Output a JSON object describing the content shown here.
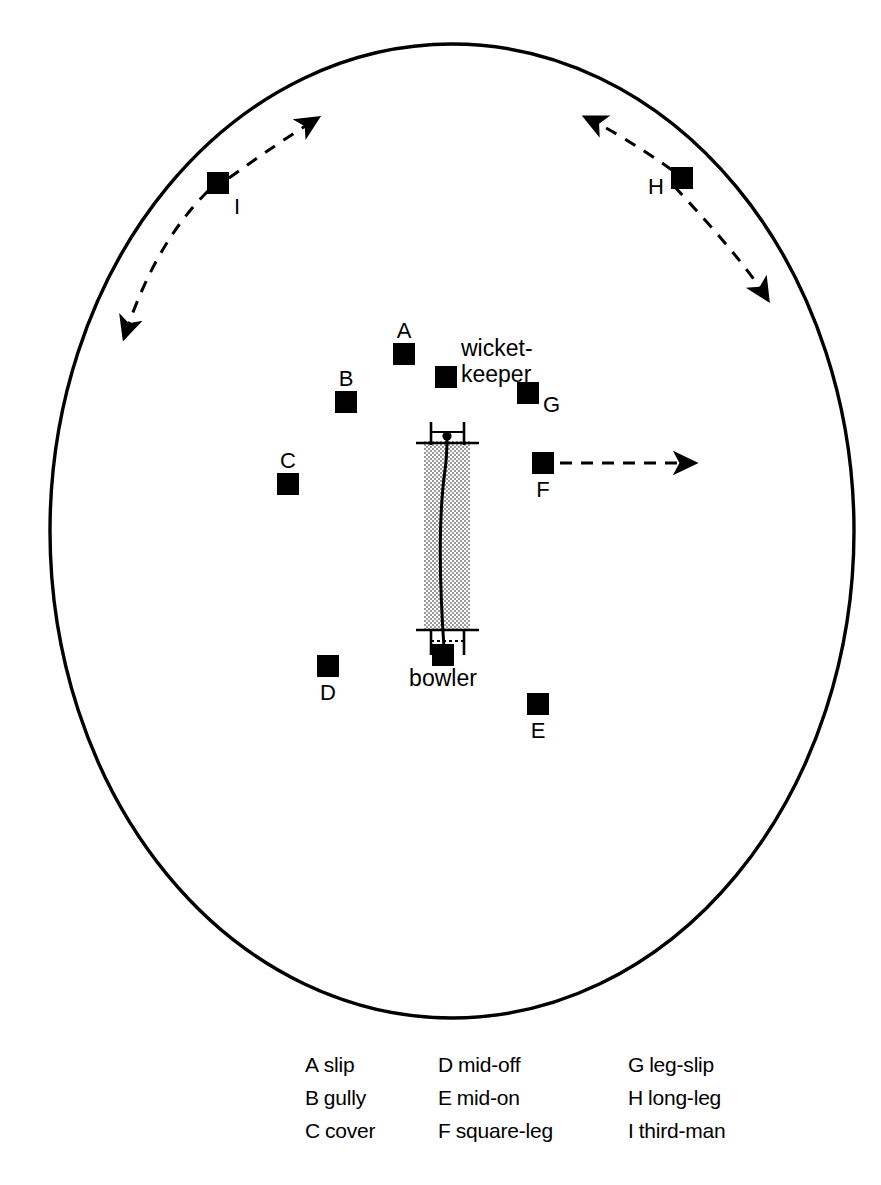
{
  "diagram": {
    "boundary": {
      "name": "boundary-oval",
      "cx": 452,
      "cy": 531,
      "rx": 402,
      "ry": 487,
      "stroke": "#000000",
      "stroke_width": 3.4
    },
    "pitch": {
      "name": "pitch",
      "x": 424,
      "y": 440,
      "width": 46,
      "height": 192,
      "fill": "stipple"
    },
    "creases": {
      "batsman_end_y": 443,
      "bowler_end_y": 629
    },
    "ball_path": {
      "name": "ball-trajectory",
      "from": "bowler",
      "to": "batsman"
    },
    "fielders": [
      {
        "key": "A",
        "role": "slip",
        "x": 404,
        "y": 354,
        "label_pos": "above"
      },
      {
        "key": "B",
        "role": "gully",
        "x": 346,
        "y": 402,
        "label_pos": "above"
      },
      {
        "key": "C",
        "role": "cover",
        "x": 288,
        "y": 484,
        "label_pos": "above"
      },
      {
        "key": "D",
        "role": "mid-off",
        "x": 328,
        "y": 666,
        "label_pos": "below"
      },
      {
        "key": "E",
        "role": "mid-on",
        "x": 538,
        "y": 704,
        "label_pos": "below"
      },
      {
        "key": "F",
        "role": "square-leg",
        "x": 543,
        "y": 463,
        "label_pos": "below"
      },
      {
        "key": "G",
        "role": "leg-slip",
        "x": 528,
        "y": 393,
        "label_pos": "right"
      },
      {
        "key": "H",
        "role": "long-leg",
        "x": 681,
        "y": 177,
        "label_pos": "left"
      },
      {
        "key": "I",
        "role": "third-man",
        "x": 218,
        "y": 183,
        "label_pos": "below-right"
      }
    ],
    "named_players": [
      {
        "name": "wicket-keeper",
        "line1": "wicket-",
        "line2": "keeper",
        "x": 446,
        "y": 377
      },
      {
        "name": "bowler",
        "line1": "bowler",
        "x": 443,
        "y": 655
      }
    ],
    "arrows": [
      {
        "name": "third-man-range-arrow",
        "style": "dashed-double-arc",
        "for": "I"
      },
      {
        "name": "long-leg-range-arrow",
        "style": "dashed-double-arc",
        "for": "H"
      },
      {
        "name": "square-leg-direction-arrow",
        "style": "dashed-single",
        "for": "F"
      }
    ]
  },
  "legend": {
    "rows": [
      [
        {
          "key": "A",
          "label": "slip"
        },
        {
          "key": "D",
          "label": "mid-off"
        },
        {
          "key": "G",
          "label": "leg-slip"
        }
      ],
      [
        {
          "key": "B",
          "label": "gully"
        },
        {
          "key": "E",
          "label": "mid-on"
        },
        {
          "key": "H",
          "label": "long-leg"
        }
      ],
      [
        {
          "key": "C",
          "label": "cover"
        },
        {
          "key": "F",
          "label": "square-leg"
        },
        {
          "key": "I",
          "label": "third-man"
        }
      ]
    ]
  }
}
